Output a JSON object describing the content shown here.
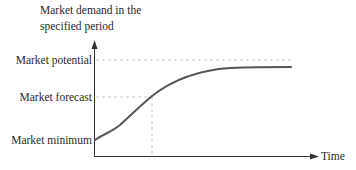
{
  "diagram": {
    "y_axis_title_line1": "Market demand in the",
    "y_axis_title_line2": "specified period",
    "x_axis_label": "Time",
    "levels": [
      {
        "name": "potential",
        "label": "Market potential"
      },
      {
        "name": "forecast",
        "label": "Market forecast"
      },
      {
        "name": "minimum",
        "label": "Market minimum"
      }
    ],
    "colors": {
      "curve": "#555555",
      "axis": "#333333",
      "dashed": "#c8c8c8",
      "text": "#2a2a2a"
    }
  }
}
